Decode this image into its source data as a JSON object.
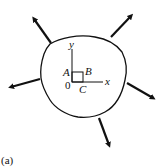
{
  "figure": {
    "caption": "(a)",
    "labels": {
      "y_axis": "y",
      "x_axis": "x",
      "point_a": "A",
      "point_b": "B",
      "point_c": "C",
      "origin": "0"
    },
    "arrows": [
      {
        "name": "arrow-upper-left"
      },
      {
        "name": "arrow-upper-right"
      },
      {
        "name": "arrow-left"
      },
      {
        "name": "arrow-right"
      },
      {
        "name": "arrow-bottom"
      }
    ],
    "stroke_color": "#111111"
  }
}
